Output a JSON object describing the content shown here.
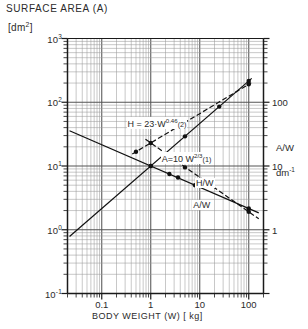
{
  "chart_data": {
    "type": "line",
    "title": "SURFACE AREA (A)",
    "ylabel": "[dm2]",
    "ylabel_html": "[dm<sup>2</sup>]",
    "xlabel": "BODY WEIGHT (W) [ kg]",
    "right_axis_name": "A/W",
    "right_axis_unit": "dm-1",
    "right_axis_unit_html": "dm<sup>-1</sup>",
    "scale": "log-log",
    "grid": true,
    "legend_position": "inline-annotations",
    "xlim": [
      0.02,
      200
    ],
    "ylim": [
      0.1,
      1000
    ],
    "right_ylim": [
      0.1,
      1000
    ],
    "x_ticks": [
      "0.1",
      "1",
      "10",
      "100"
    ],
    "x_tick_values": [
      0.1,
      1,
      10,
      100
    ],
    "y_ticks": [
      "10-1",
      "100",
      "101",
      "102",
      "103"
    ],
    "y_tick_html": [
      "10<sup>-1</sup>",
      "10<sup>0</sup>",
      "10<sup>1</sup>",
      "10<sup>2</sup>",
      "10<sup>3</sup>"
    ],
    "y_tick_values": [
      0.1,
      1,
      10,
      100,
      1000
    ],
    "right_ticks": [
      "1",
      "10",
      "100"
    ],
    "right_tick_values": [
      1,
      10,
      100
    ],
    "series": [
      {
        "name": "A = 10 W^2/3",
        "label": "A=10 W2/3(1)",
        "label_html": "A=10 W<sup>2/3</sup><span style=\"font-size:.8em\">(1)</span>",
        "style": "solid",
        "equation": "A = 10 * W^(2/3)",
        "exponent": 0.6667,
        "coefficient": 10,
        "points_x": [
          1,
          5,
          25,
          100
        ],
        "points_y": [
          10,
          29.2,
          85.5,
          215
        ]
      },
      {
        "name": "H = 23 W^0.46",
        "label": "H = 23·W0.46(2)",
        "label_html": "H = 23·W<sup>0.46</sup><span style=\"font-size:.8em\">(2)</span>",
        "style": "dashed",
        "equation": "H = 23 * W^0.46",
        "exponent": 0.46,
        "coefficient": 23,
        "points_x": [
          0.5,
          100
        ],
        "points_y": [
          16.7,
          192
        ]
      },
      {
        "name": "A/W",
        "label": "A/W",
        "style": "solid-descending",
        "equation": "A/W = 10 * W^(-1/3)",
        "exponent": -0.3333,
        "coefficient": 10,
        "points_x": [
          1,
          2.4,
          3.6,
          8,
          100
        ],
        "points_y": [
          10,
          7.5,
          6.6,
          5.0,
          2.15
        ]
      },
      {
        "name": "H/W",
        "label": "H/W",
        "style": "dashed-descending",
        "equation": "H/W = 23 * W^(-0.54)",
        "exponent": -0.54,
        "coefficient": 23,
        "points_x": [
          1,
          5,
          100
        ],
        "points_y": [
          23,
          9.5,
          1.92
        ]
      }
    ],
    "annotations": [
      {
        "text": "H = 23·W0.46(2)",
        "x": 0.32,
        "y": 47
      },
      {
        "text": "A=10 W2/3(1)",
        "x": 1.6,
        "y": 13.5
      },
      {
        "text": "H/W",
        "x": 8.0,
        "y": 5.2
      },
      {
        "text": "A/W",
        "x": 7.0,
        "y": 2.4
      }
    ],
    "colors": {
      "axis": "#1a1a1a",
      "grid_major": "#555555",
      "grid_minor": "#9a9a9a",
      "data_line": "#111111",
      "background": "#ffffff"
    }
  }
}
